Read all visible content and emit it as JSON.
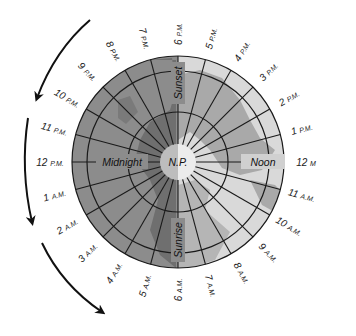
{
  "diagram": {
    "type": "polar-day-night-clock",
    "center_label": "N.P.",
    "inner_labels": {
      "top": "Sunset",
      "right": "Noon",
      "bottom": "Sunrise",
      "left": "Midnight"
    },
    "hour_labels": [
      {
        "num": "12",
        "suffix": "M",
        "angle": 0
      },
      {
        "num": "1",
        "suffix": "P.M.",
        "angle": -15
      },
      {
        "num": "2",
        "suffix": "P.M.",
        "angle": -30
      },
      {
        "num": "3",
        "suffix": "P.M.",
        "angle": -45
      },
      {
        "num": "4",
        "suffix": "P.M.",
        "angle": -60
      },
      {
        "num": "5",
        "suffix": "P.M.",
        "angle": -75
      },
      {
        "num": "6",
        "suffix": "P.M.",
        "angle": -90
      },
      {
        "num": "7",
        "suffix": "P.M.",
        "angle": -105
      },
      {
        "num": "8",
        "suffix": "P.M.",
        "angle": -120
      },
      {
        "num": "9",
        "suffix": "P.M.",
        "angle": -135
      },
      {
        "num": "10",
        "suffix": "P.M.",
        "angle": -150
      },
      {
        "num": "11",
        "suffix": "P.M.",
        "angle": -165
      },
      {
        "num": "12",
        "suffix": "P.M.",
        "angle": 180
      },
      {
        "num": "1",
        "suffix": "A.M.",
        "angle": 165
      },
      {
        "num": "2",
        "suffix": "A.M.",
        "angle": 150
      },
      {
        "num": "3",
        "suffix": "A.M.",
        "angle": 135
      },
      {
        "num": "4",
        "suffix": "A.M.",
        "angle": 120
      },
      {
        "num": "5",
        "suffix": "A.M.",
        "angle": 105
      },
      {
        "num": "6",
        "suffix": "A.M.",
        "angle": 90
      },
      {
        "num": "7",
        "suffix": "A.M.",
        "angle": 75
      },
      {
        "num": "8",
        "suffix": "A.M.",
        "angle": 60
      },
      {
        "num": "9",
        "suffix": "A.M.",
        "angle": 45
      },
      {
        "num": "10",
        "suffix": "A.M.",
        "angle": 30
      },
      {
        "num": "11",
        "suffix": "A.M.",
        "angle": 15
      }
    ],
    "arrows": {
      "count": 3,
      "direction": "counterclockwise"
    },
    "colors": {
      "night_ocean": "#8c8c8c",
      "night_land": "#6f6f6f",
      "day_ocean": "#d9d9d9",
      "day_land": "#a9a9a9",
      "grid": "#1a1a1a",
      "arrow": "#111111"
    }
  }
}
